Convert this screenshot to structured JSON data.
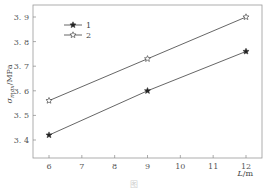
{
  "chart_data": {
    "type": "line",
    "title": "",
    "xlabel": "L/m",
    "ylabel": "σmax/MPa",
    "ylabel_main": "σ",
    "ylabel_sub": "max",
    "ylabel_unit": "/MPa",
    "xlabel_main": "L",
    "xlabel_unit": "/m",
    "xlim": [
      5.5,
      12.6
    ],
    "ylim": [
      3.35,
      3.95
    ],
    "xticks": [
      6,
      7,
      8,
      9,
      10,
      11,
      12
    ],
    "yticks": [
      3.4,
      3.5,
      3.6,
      3.7,
      3.8,
      3.9
    ],
    "ytick_labels": [
      "3. 4",
      "3. 5",
      "3. 6",
      "3. 7",
      "3. 8",
      "3. 9"
    ],
    "grid": false,
    "legend_position": "top-left",
    "series": [
      {
        "name": "1",
        "marker": "filled-star",
        "x": [
          6,
          9,
          12
        ],
        "values": [
          3.42,
          3.6,
          3.76
        ]
      },
      {
        "name": "2",
        "marker": "open-star",
        "x": [
          6,
          9,
          12
        ],
        "values": [
          3.56,
          3.73,
          3.9
        ]
      }
    ],
    "colors": {
      "line": "#555555",
      "axis": "#888888"
    }
  },
  "caption": "图"
}
